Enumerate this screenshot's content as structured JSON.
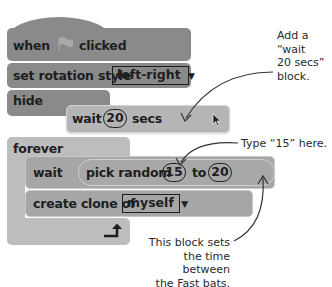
{
  "script": {
    "hat": {
      "when": "when",
      "flag_icon": "green-flag",
      "clicked": "clicked"
    },
    "set_rotation": {
      "label": "set rotation style",
      "value": "left-right"
    },
    "hide": {
      "label": "hide"
    },
    "wait_float": {
      "label": "wait",
      "value": "20",
      "unit": "secs"
    },
    "forever": {
      "label": "forever"
    },
    "wait_random": {
      "label": "wait",
      "reporter": "pick random",
      "from": "15",
      "to_label": "to",
      "to": "20"
    },
    "create_clone": {
      "label": "create clone of",
      "value": "myself"
    },
    "loop_arrow": "↰"
  },
  "annotations": {
    "add_wait": [
      "Add a",
      "“wait",
      "20 secs”",
      "block."
    ],
    "type_15": "Type “15” here.",
    "time_between": [
      "This block sets",
      "the time between",
      "the Fast bats."
    ]
  },
  "colors": {
    "dark_block": "#8a8a8a",
    "mid_block": "#a6a6a6",
    "light_block": "#bdbdbd",
    "text": "#1e1e1e"
  }
}
